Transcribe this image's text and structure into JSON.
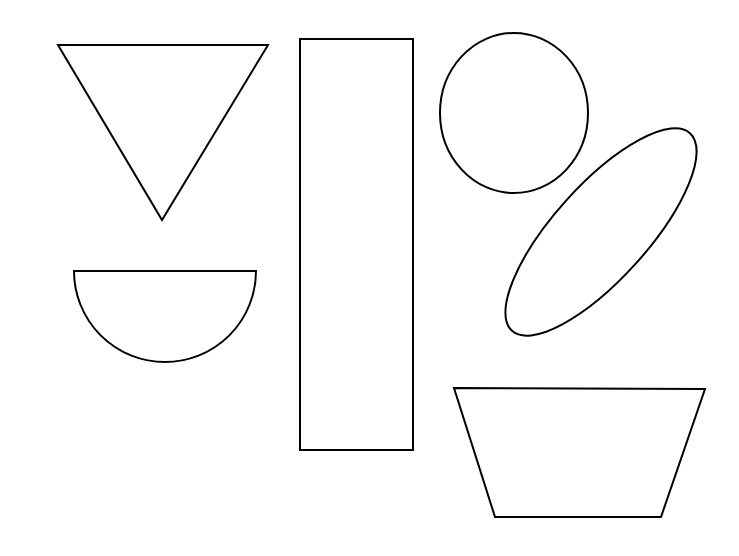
{
  "canvas": {
    "width": 739,
    "height": 556,
    "background_color": "#ffffff",
    "stroke_color": "#000000",
    "fill_color": "#ffffff",
    "stroke_width": 2,
    "shape_count": 6,
    "title": "Geometric Shapes Outline Figure"
  },
  "shapes": [
    {
      "id": "triangle-down",
      "name": "inverted triangle",
      "type": "polygon",
      "points": "58,45 268,45 162,220",
      "bbox": [
        58,
        45,
        210,
        175
      ],
      "color": "#000000"
    },
    {
      "id": "semicircle-down",
      "name": "semicircle flat side up",
      "type": "path",
      "path": "M 74,271 L 256,271 A 91,91 0 0 1 74,271 Z",
      "bbox": [
        74,
        271,
        182,
        91
      ],
      "color": "#000000"
    },
    {
      "id": "rectangle-tall",
      "name": "tall vertical rectangle",
      "type": "rect",
      "x": 300,
      "y": 39,
      "width": 113,
      "height": 411,
      "color": "#000000"
    },
    {
      "id": "circle",
      "name": "circle",
      "type": "ellipse",
      "cx": 514,
      "cy": 113,
      "rx": 74,
      "ry": 80,
      "rotation": 0,
      "color": "#000000"
    },
    {
      "id": "ellipse-tilted",
      "name": "tilted ellipse",
      "type": "ellipse",
      "cx": 601,
      "cy": 232,
      "rx": 133,
      "ry": 47,
      "rotation": -48,
      "color": "#000000"
    },
    {
      "id": "trapezoid",
      "name": "trapezoid wide top",
      "type": "polygon",
      "points": "454,388 705,389 661,517 495,517",
      "bbox": [
        454,
        388,
        251,
        129
      ],
      "color": "#000000"
    }
  ]
}
